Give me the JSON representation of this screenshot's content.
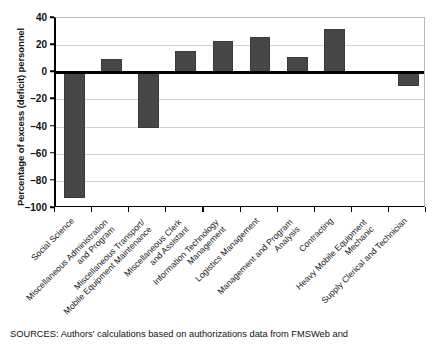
{
  "chart_data": {
    "type": "bar",
    "title": "",
    "xlabel": "",
    "ylabel": "Percentage of excess (deficit) personnel",
    "ylim": [
      -100,
      40
    ],
    "yticks": [
      40,
      20,
      0,
      -20,
      -40,
      -60,
      -80,
      -100
    ],
    "ytick_labels": [
      "40",
      "20",
      "0",
      "–20",
      "–40",
      "–60",
      "–80",
      "–100"
    ],
    "grid": true,
    "legend": "none",
    "categories": [
      "Social Science",
      "Miscellaneous Administration and Program",
      "Miscellaneous Transport/ Mobile Equipment Maintenance",
      "Miscellaneous Clerk and Assistant",
      "Information Technology Management",
      "Logistics Management",
      "Management and Program Analysis",
      "Contracting",
      "Heavy Mobile Equipment Mechanic",
      "Supply Clerical and Technician"
    ],
    "category_lines": [
      [
        "Social Science",
        ""
      ],
      [
        "Miscellaneous Administration",
        "and Program"
      ],
      [
        "Miscellaneous Transport/",
        "Mobile Equipment Maintenance"
      ],
      [
        "Miscellaneous Clerk",
        "and Assistant"
      ],
      [
        "Information Technology",
        "Management"
      ],
      [
        "Logistics Management",
        ""
      ],
      [
        "Management and Program",
        "Analysis"
      ],
      [
        "Contracting",
        ""
      ],
      [
        "Heavy Mobile Equipment",
        "Mechanic"
      ],
      [
        "Supply Clerical and Technician",
        ""
      ]
    ],
    "values": [
      -93,
      10,
      -41,
      16,
      23,
      26,
      11,
      32,
      0,
      -10
    ],
    "bar_color": "#474747"
  },
  "source_note": "SOURCES: Authors' calculations based on authorizations data from FMSWeb and"
}
